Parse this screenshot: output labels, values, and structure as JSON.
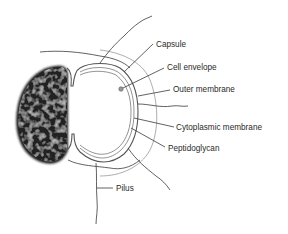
{
  "diagram": {
    "type": "labeled-illustration",
    "colors": {
      "background": "#ffffff",
      "line": "#3a3a3a",
      "text": "#2a2a2a",
      "dark_cell": "#1e1e1e"
    },
    "labels": [
      {
        "id": "capsule",
        "text": "Capsule"
      },
      {
        "id": "cell-envelope",
        "text": "Cell envelope"
      },
      {
        "id": "outer-membrane",
        "text": "Outer membrane"
      },
      {
        "id": "cytoplasmic-membrane",
        "text": "Cytoplasmic membrane"
      },
      {
        "id": "peptidoglycan",
        "text": "Peptidoglycan"
      },
      {
        "id": "pilus",
        "text": "Pilus"
      }
    ]
  }
}
